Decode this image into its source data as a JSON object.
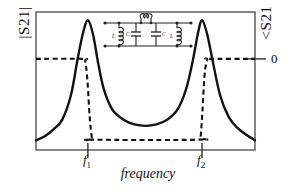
{
  "figure": {
    "axis_left_label": "|S21|",
    "axis_right_label": "<S21",
    "axis_x_label": "frequency",
    "right_tick_label": "0",
    "tick_f1": "f",
    "tick_f1_sub": "1",
    "tick_f2": "f",
    "tick_f2_sub": "2",
    "line_color": "#111111",
    "frame_color": "#444444",
    "background": "#ffffff"
  },
  "inset_circuit": {
    "name": "dual-resonator-coupled-lc-network",
    "labels": {
      "inductor_left": "L",
      "capacitor_left": "C",
      "capacitor_right": "C",
      "inductor_right": "L"
    }
  },
  "chart_data": {
    "type": "line",
    "title": "",
    "xlabel": "frequency",
    "ylabel": "|S21|",
    "y2label": "<S21",
    "grid": false,
    "legend": null,
    "xlim": [
      0,
      1
    ],
    "ylim": [
      0,
      1
    ],
    "xticks": [
      0.237,
      0.758
    ],
    "xticklabels": [
      "f1",
      "f2"
    ],
    "y2ticks": [
      0
    ],
    "y2ticklabels": [
      "0"
    ],
    "series": [
      {
        "name": "|S21| magnitude",
        "style": "solid",
        "axis": "left",
        "x": [
          0.0,
          0.04,
          0.08,
          0.12,
          0.16,
          0.19,
          0.215,
          0.237,
          0.26,
          0.285,
          0.31,
          0.35,
          0.4,
          0.45,
          0.5,
          0.55,
          0.6,
          0.645,
          0.685,
          0.715,
          0.74,
          0.758,
          0.78,
          0.805,
          0.84,
          0.88,
          0.92,
          0.96,
          1.0
        ],
        "y": [
          0.07,
          0.1,
          0.15,
          0.22,
          0.4,
          0.66,
          0.85,
          0.94,
          0.84,
          0.62,
          0.44,
          0.29,
          0.22,
          0.185,
          0.175,
          0.185,
          0.22,
          0.29,
          0.44,
          0.64,
          0.85,
          0.94,
          0.85,
          0.66,
          0.4,
          0.24,
          0.16,
          0.11,
          0.07
        ]
      },
      {
        "name": "<S21 phase",
        "style": "dashed",
        "axis": "right",
        "x": [
          0.0,
          0.215,
          0.225,
          0.235,
          0.245,
          0.255,
          0.26,
          0.745,
          0.752,
          0.76,
          0.77,
          0.782,
          0.79,
          1.0
        ],
        "y": [
          0.66,
          0.66,
          0.64,
          0.5,
          0.24,
          0.09,
          0.075,
          0.075,
          0.1,
          0.28,
          0.55,
          0.655,
          0.66,
          0.66
        ]
      }
    ]
  }
}
